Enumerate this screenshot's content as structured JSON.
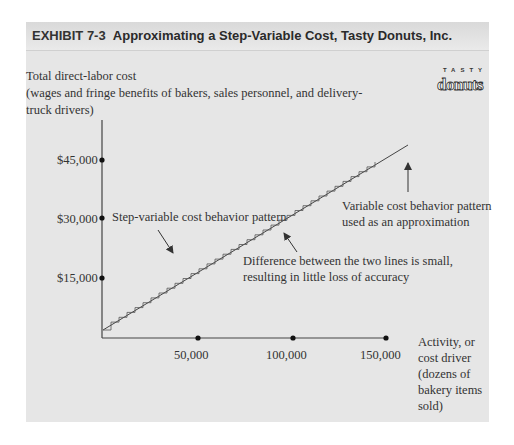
{
  "header": {
    "exhibit": "EXHIBIT 7-3",
    "title": "Approximating a Step-Variable Cost, Tasty Donuts, Inc."
  },
  "logo": {
    "top": "TASTY",
    "word": "donuts",
    "icon": "donut-logo-icon"
  },
  "y_axis_title": {
    "line1": "Total direct-labor cost",
    "line2": "(wages and fringe benefits of bakers, sales personnel, and delivery-",
    "line3": "truck drivers)"
  },
  "y_ticks": [
    "$45,000",
    "$30,000",
    "$15,000"
  ],
  "x_ticks": [
    "50,000",
    "100,000",
    "150,000"
  ],
  "x_axis_title": [
    "Activity, or",
    "cost driver",
    "(dozens of",
    "bakery items",
    "sold)"
  ],
  "annotations": {
    "step": "Step-variable cost behavior pattern",
    "variable_line1": "Variable cost behavior pattern",
    "variable_line2": "used as an approximation",
    "difference_line1": "Difference between the two lines is small,",
    "difference_line2": "resulting in little loss of accuracy"
  },
  "chart_data": {
    "type": "line",
    "title": "EXHIBIT 7-3 Approximating a Step-Variable Cost, Tasty Donuts, Inc.",
    "xlabel": "Activity, or cost driver (dozens of bakery items sold)",
    "ylabel": "Total direct-labor cost (wages and fringe benefits of bakers, sales personnel, and delivery-truck drivers)",
    "x_ticks": [
      50000,
      100000,
      150000
    ],
    "y_ticks": [
      15000,
      30000,
      45000
    ],
    "xlim": [
      0,
      150000
    ],
    "ylim": [
      0,
      50000
    ],
    "grid": false,
    "series": [
      {
        "name": "Variable cost behavior pattern used as an approximation",
        "kind": "straight line",
        "x": [
          0,
          150000
        ],
        "y": [
          3000,
          52000
        ]
      },
      {
        "name": "Step-variable cost behavior pattern",
        "kind": "step",
        "x": [
          0,
          140000
        ],
        "y": [
          3000,
          48000
        ]
      }
    ],
    "annotations": [
      "Step-variable cost behavior pattern",
      "Variable cost behavior pattern used as an approximation",
      "Difference between the two lines is small, resulting in little loss of accuracy"
    ]
  }
}
